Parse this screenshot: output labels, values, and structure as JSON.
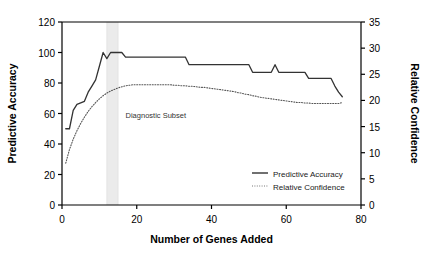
{
  "chart_data": {
    "type": "line",
    "title": "",
    "xlabel": "Number of Genes Added",
    "ylabel": "Predictive Accuracy",
    "y2label": "Relative Confidence",
    "xlim": [
      0,
      80
    ],
    "ylim": [
      0,
      120
    ],
    "y2lim": [
      0,
      35
    ],
    "xticks": [
      0,
      20,
      40,
      60,
      80
    ],
    "yticks": [
      0,
      20,
      40,
      60,
      80,
      100,
      120
    ],
    "y2ticks": [
      0,
      5,
      10,
      15,
      20,
      25,
      30,
      35
    ],
    "grid": false,
    "legend_position": "bottom-right",
    "annotations": [
      {
        "text": "Diagnostic Subset",
        "x": 17,
        "y": 57
      }
    ],
    "shaded_band": {
      "label": "Diagnostic Subset",
      "x_start": 12,
      "x_end": 15,
      "color": "#ebebeb"
    },
    "series": [
      {
        "name": "Predictive Accuracy",
        "axis": "left",
        "style": "solid",
        "color": "#333333",
        "x": [
          1,
          2,
          3,
          4,
          5,
          6,
          7,
          8,
          9,
          10,
          11,
          12,
          13,
          14,
          15,
          16,
          17,
          18,
          19,
          20,
          21,
          22,
          23,
          24,
          25,
          26,
          27,
          28,
          29,
          30,
          31,
          32,
          33,
          34,
          35,
          36,
          37,
          38,
          39,
          40,
          41,
          42,
          43,
          44,
          45,
          46,
          47,
          48,
          49,
          50,
          51,
          52,
          53,
          54,
          55,
          56,
          57,
          58,
          59,
          60,
          61,
          62,
          63,
          64,
          65,
          66,
          67,
          68,
          69,
          70,
          71,
          72,
          73,
          74,
          75
        ],
        "y": [
          50,
          50,
          62,
          66,
          67,
          68,
          74,
          78,
          82,
          91,
          100,
          96,
          100,
          100,
          100,
          100,
          97,
          97,
          97,
          97,
          97,
          97,
          97,
          97,
          97,
          97,
          97,
          97,
          97,
          97,
          97,
          97,
          97,
          92,
          92,
          92,
          92,
          92,
          92,
          92,
          92,
          92,
          92,
          92,
          92,
          92,
          92,
          92,
          92,
          92,
          87,
          87,
          87,
          87,
          87,
          87,
          92,
          87,
          87,
          87,
          87,
          87,
          87,
          87,
          87,
          83,
          83,
          83,
          83,
          83,
          83,
          83,
          78,
          74,
          71
        ]
      },
      {
        "name": "Relative Confidence",
        "axis": "right",
        "style": "dotted",
        "color": "#555555",
        "x": [
          1,
          2,
          3,
          4,
          5,
          6,
          7,
          8,
          9,
          10,
          11,
          12,
          13,
          14,
          15,
          16,
          17,
          18,
          19,
          20,
          21,
          22,
          23,
          24,
          25,
          26,
          27,
          28,
          29,
          30,
          31,
          32,
          33,
          34,
          35,
          36,
          37,
          38,
          39,
          40,
          41,
          42,
          43,
          44,
          45,
          46,
          47,
          48,
          49,
          50,
          51,
          52,
          53,
          54,
          55,
          56,
          57,
          58,
          59,
          60,
          61,
          62,
          63,
          64,
          65,
          66,
          67,
          68,
          69,
          70,
          71,
          72,
          73,
          74,
          75
        ],
        "y": [
          8.0,
          10.6,
          12.6,
          14.2,
          15.6,
          16.8,
          17.9,
          18.8,
          19.6,
          20.3,
          20.9,
          21.4,
          21.8,
          22.1,
          22.4,
          22.6,
          22.8,
          22.9,
          23.0,
          23.0,
          23.0,
          23.0,
          23.0,
          23.0,
          23.0,
          23.0,
          23.0,
          23.0,
          23.0,
          22.9,
          22.9,
          22.8,
          22.8,
          22.7,
          22.7,
          22.6,
          22.5,
          22.5,
          22.4,
          22.3,
          22.2,
          22.1,
          22.0,
          21.9,
          21.8,
          21.7,
          21.5,
          21.4,
          21.2,
          21.1,
          20.9,
          20.8,
          20.6,
          20.5,
          20.4,
          20.3,
          20.2,
          20.1,
          20.0,
          19.9,
          19.8,
          19.7,
          19.6,
          19.6,
          19.5,
          19.5,
          19.4,
          19.4,
          19.4,
          19.4,
          19.4,
          19.4,
          19.4,
          19.4,
          19.6
        ]
      }
    ],
    "legend": [
      {
        "label": "Predictive Accuracy",
        "style": "solid",
        "color": "#333333"
      },
      {
        "label": "Relative Confidence",
        "style": "dotted",
        "color": "#777777"
      }
    ]
  }
}
